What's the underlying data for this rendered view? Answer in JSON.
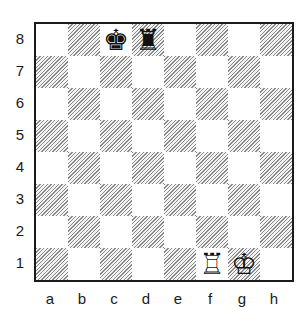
{
  "board": {
    "ranks": [
      "8",
      "7",
      "6",
      "5",
      "4",
      "3",
      "2",
      "1"
    ],
    "files": [
      "a",
      "b",
      "c",
      "d",
      "e",
      "f",
      "g",
      "h"
    ],
    "pieces": {
      "c8": {
        "glyph": "♚",
        "name": "black-king"
      },
      "d8": {
        "glyph": "♜",
        "name": "black-rook"
      },
      "f1": {
        "glyph": "♖",
        "name": "white-rook"
      },
      "g1": {
        "glyph": "♔",
        "name": "white-king"
      }
    }
  }
}
